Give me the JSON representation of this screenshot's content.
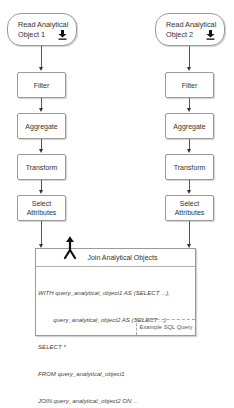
{
  "left_pipeline": {
    "source": {
      "line1": "Read Analytical",
      "line2": "Object 1",
      "icon": "download-icon"
    },
    "steps": [
      {
        "label": "Filter"
      },
      {
        "label": "Aggregate"
      },
      {
        "label": "Transform"
      },
      {
        "label": "Select\nAttributes",
        "line1": "Select",
        "line2": "Attributes"
      }
    ]
  },
  "right_pipeline": {
    "source": {
      "line1": "Read Analytical",
      "line2": "Object 2",
      "icon": "download-icon"
    },
    "steps": [
      {
        "label": "Filter"
      },
      {
        "label": "Aggregate"
      },
      {
        "label": "Transform"
      },
      {
        "label": "Select\nAttributes",
        "line1": "Select",
        "line2": "Attributes"
      }
    ]
  },
  "join": {
    "title": "Join Analytical Objects",
    "icon": "merge-icon",
    "sql_lines": [
      "WITH query_analytical_object1 AS (SELECT ...),",
      "         query_analytical_object2 AS (SELECT ...)",
      "SELECT *",
      "FROM query_analytical_object1",
      "JOIN query_analytical_object2 ON ..."
    ],
    "annotation": "Example SQL Query"
  }
}
